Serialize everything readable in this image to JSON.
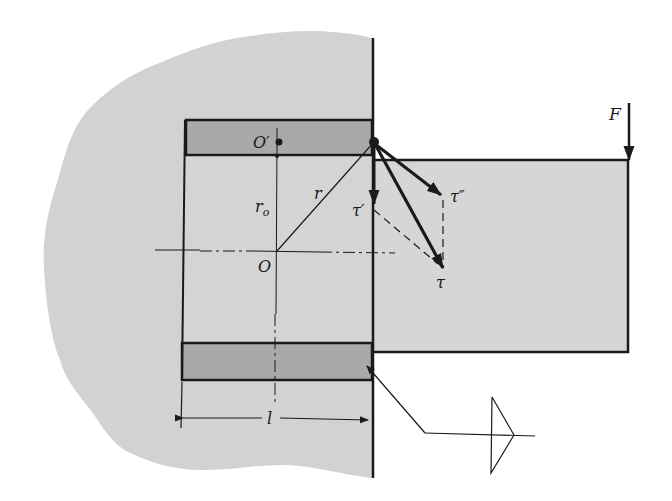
{
  "figure": {
    "colors": {
      "background": "#ffffff",
      "support_fill": "#d2d2d2",
      "weld_fill": "#a9a9a9",
      "beam_fill": "#d6d6d6",
      "line": "#1a1a1a"
    },
    "labels": {
      "force": "F",
      "centroid": "O",
      "weld_centroid": "O′",
      "radius": "r",
      "offset_radius": "r",
      "offset_radius_sub": "o",
      "tau_primary": "τ′",
      "tau_secondary": "τ″",
      "tau_resultant": "τ",
      "length": "l"
    },
    "weld_symbol": {
      "type": "fillet-weld-triangle",
      "side": "arrow-side"
    }
  }
}
